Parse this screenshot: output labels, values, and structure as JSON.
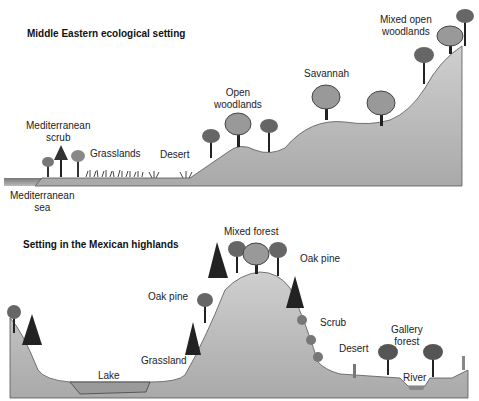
{
  "top_panel": {
    "title": "Middle Eastern ecological setting",
    "labels": {
      "mediterranean_scrub_1": "Mediterranean",
      "mediterranean_scrub_2": "scrub",
      "grasslands": "Grasslands",
      "desert": "Desert",
      "open_woodlands_1": "Open",
      "open_woodlands_2": "woodlands",
      "savannah": "Savannah",
      "mixed_open_woodlands_1": "Mixed open",
      "mixed_open_woodlands_2": "woodlands",
      "mediterranean_sea_1": "Mediterranean",
      "mediterranean_sea_2": "sea"
    }
  },
  "bottom_panel": {
    "title": "Setting in the Mexican highlands",
    "labels": {
      "mixed_forest": "Mixed forest",
      "oak_pine_left": "Oak pine",
      "oak_pine_right": "Oak pine",
      "scrub": "Scrub",
      "lake": "Lake",
      "grassland": "Grassland",
      "desert": "Desert",
      "gallery_forest_1": "Gallery",
      "gallery_forest_2": "forest",
      "river": "River"
    }
  },
  "colors": {
    "ground": "#bdbdbd",
    "ground_dark": "#8a8a8a",
    "tree": "#5a5a5a",
    "tree_dark": "#222222",
    "water": "#9a9a9a"
  }
}
